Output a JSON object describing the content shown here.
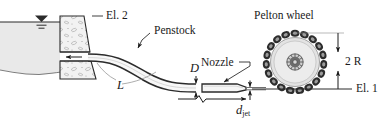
{
  "figure": {
    "name": "pelton-wheel-hydro-schematic",
    "width": 389,
    "height": 125
  },
  "labels": {
    "el2": "El. 2",
    "el1": "El. 1",
    "penstock": "Penstock",
    "pelton_wheel": "Pelton wheel",
    "nozzle": "Nozzle",
    "diameter_D": "D",
    "length_L": "L",
    "radius_2R": "2 R",
    "d_jet_main": "d",
    "d_jet_sub": "jet"
  },
  "colors": {
    "ink": "#1a1a1a",
    "line": "#2b2b2b",
    "reservoir_fill": "#e9e9e9",
    "dam_fill": "#f2f2f2",
    "wheel_disc": "#e3e3e3",
    "wheel_bucket": "#2d2d2d",
    "pipe_fill": "#f5f5f5",
    "background": "#ffffff"
  },
  "geometry": {
    "water_surface_y": 22,
    "centerline_el1_y": 89,
    "wheel_center": {
      "x": 295,
      "y": 62
    },
    "wheel_outer_radius": 30,
    "wheel_bucket_count": 19
  }
}
